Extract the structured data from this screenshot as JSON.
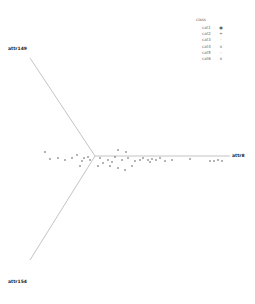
{
  "chart_data": {
    "type": "scatter",
    "subtype": "radviz",
    "title": "",
    "anchors": [
      {
        "name": "attr149",
        "x": 8,
        "y": 52
      },
      {
        "name": "attr8",
        "x": 230,
        "y": 156
      },
      {
        "name": "attr154",
        "x": 8,
        "y": 298
      }
    ],
    "center": {
      "x": 95,
      "y": 156
    },
    "legend": {
      "title": "class",
      "position": "top-right",
      "entries": [
        {
          "label": "cat1",
          "marker": "●"
        },
        {
          "label": "cat2",
          "marker": "+"
        },
        {
          "label": "cat3",
          "marker": "·"
        },
        {
          "label": "cat4",
          "marker": "×"
        },
        {
          "label": "cat5",
          "marker": "-"
        },
        {
          "label": "cat6",
          "marker": "×"
        }
      ]
    },
    "points": [
      {
        "x": 45,
        "y": 152
      },
      {
        "x": 50,
        "y": 159
      },
      {
        "x": 58,
        "y": 158
      },
      {
        "x": 65,
        "y": 160
      },
      {
        "x": 72,
        "y": 158
      },
      {
        "x": 77,
        "y": 155
      },
      {
        "x": 82,
        "y": 161
      },
      {
        "x": 84,
        "y": 158
      },
      {
        "x": 88,
        "y": 157
      },
      {
        "x": 90,
        "y": 160
      },
      {
        "x": 80,
        "y": 166
      },
      {
        "x": 100,
        "y": 158
      },
      {
        "x": 103,
        "y": 163
      },
      {
        "x": 108,
        "y": 160
      },
      {
        "x": 112,
        "y": 162
      },
      {
        "x": 115,
        "y": 157
      },
      {
        "x": 118,
        "y": 168
      },
      {
        "x": 122,
        "y": 160
      },
      {
        "x": 125,
        "y": 170
      },
      {
        "x": 128,
        "y": 158
      },
      {
        "x": 135,
        "y": 161
      },
      {
        "x": 140,
        "y": 160
      },
      {
        "x": 143,
        "y": 158
      },
      {
        "x": 148,
        "y": 160
      },
      {
        "x": 150,
        "y": 162
      },
      {
        "x": 152,
        "y": 159
      },
      {
        "x": 156,
        "y": 160
      },
      {
        "x": 160,
        "y": 158
      },
      {
        "x": 165,
        "y": 161
      },
      {
        "x": 172,
        "y": 160
      },
      {
        "x": 190,
        "y": 159
      },
      {
        "x": 210,
        "y": 161
      },
      {
        "x": 214,
        "y": 161
      },
      {
        "x": 218,
        "y": 160
      },
      {
        "x": 222,
        "y": 161
      },
      {
        "x": 118,
        "y": 150
      },
      {
        "x": 126,
        "y": 152
      },
      {
        "x": 98,
        "y": 166
      },
      {
        "x": 110,
        "y": 166
      },
      {
        "x": 132,
        "y": 166
      }
    ]
  }
}
